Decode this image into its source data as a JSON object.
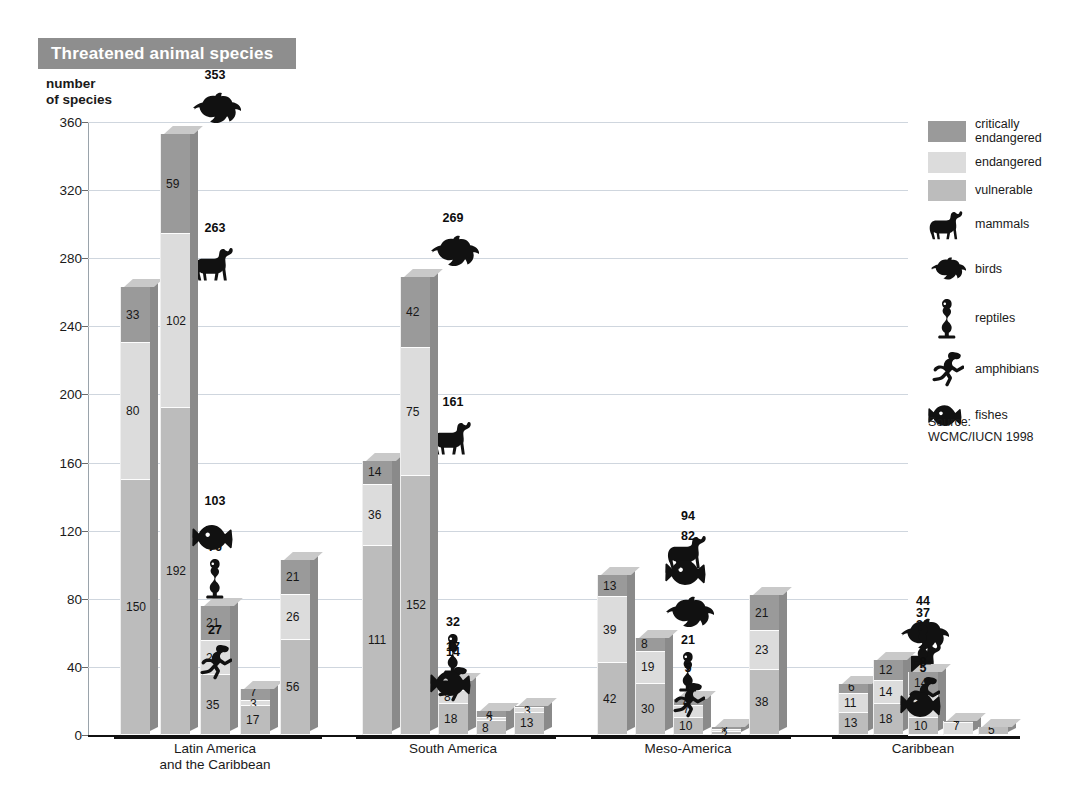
{
  "header": {
    "title": "Threatened animal species"
  },
  "axis": {
    "y_label_line1": "number",
    "y_label_line2": "of species",
    "y_ticks": [
      "360",
      "320",
      "280",
      "240",
      "200",
      "160",
      "120",
      "80",
      "40",
      "0"
    ]
  },
  "legend": {
    "swatches": [
      {
        "key": "c",
        "label_line1": "critically",
        "label_line2": "endangered",
        "color": "#9a9a9a"
      },
      {
        "key": "e",
        "label_line1": "endangered",
        "label_line2": "",
        "color": "#dcdcdc"
      },
      {
        "key": "v",
        "label_line1": "vulnerable",
        "label_line2": "",
        "color": "#bcbcbc"
      }
    ],
    "animals": [
      {
        "icon": "mammal-icon",
        "label": "mammals"
      },
      {
        "icon": "bird-icon",
        "label": "birds"
      },
      {
        "icon": "reptile-icon",
        "label": "reptiles"
      },
      {
        "icon": "amphibian-icon",
        "label": "amphibians"
      },
      {
        "icon": "fish-icon",
        "label": "fishes"
      }
    ]
  },
  "source": {
    "line1": "Source:",
    "line2": "WCMC/IUCN 1998"
  },
  "chart_data": {
    "type": "bar",
    "title": "Threatened animal species",
    "xlabel": "",
    "ylabel": "number of species",
    "ylim": [
      0,
      360
    ],
    "ytick_step": 40,
    "grid": true,
    "legend_position": "right",
    "stacked": true,
    "stack_order_bottom_to_top": [
      "vulnerable",
      "endangered",
      "critically endangered"
    ],
    "series": [
      {
        "name": "critically endangered",
        "color": "#9a9a9a"
      },
      {
        "name": "endangered",
        "color": "#dcdcdc"
      },
      {
        "name": "vulnerable",
        "color": "#bcbcbc"
      }
    ],
    "categories": [
      "Latin America and the Caribbean",
      "South America",
      "Meso-America",
      "Caribbean"
    ],
    "groups": [
      {
        "name": "Latin America\nand the Caribbean",
        "label_line1": "Latin America",
        "label_line2": "and the Caribbean",
        "bars": [
          {
            "animal": "mammals",
            "icon": "mammal-icon",
            "total": 263,
            "critically_endangered": 33,
            "endangered": 80,
            "vulnerable": 150
          },
          {
            "animal": "birds",
            "icon": "bird-icon",
            "total": 353,
            "critically_endangered": 59,
            "endangered": 102,
            "vulnerable": 192
          },
          {
            "animal": "reptiles",
            "icon": "reptile-icon",
            "total": 76,
            "critically_endangered": 21,
            "endangered": 20,
            "vulnerable": 35
          },
          {
            "animal": "amphibians",
            "icon": "amphibian-icon",
            "total": 27,
            "critically_endangered": 7,
            "endangered": 3,
            "vulnerable": 17
          },
          {
            "animal": "fishes",
            "icon": "fish-icon",
            "total": 103,
            "critically_endangered": 21,
            "endangered": 26,
            "vulnerable": 56
          }
        ]
      },
      {
        "name": "South America",
        "label_line1": "South America",
        "label_line2": "",
        "bars": [
          {
            "animal": "mammals",
            "icon": "mammal-icon",
            "total": 161,
            "critically_endangered": 14,
            "endangered": 36,
            "vulnerable": 111
          },
          {
            "animal": "birds",
            "icon": "bird-icon",
            "total": 269,
            "critically_endangered": 42,
            "endangered": 75,
            "vulnerable": 152
          },
          {
            "animal": "reptiles",
            "icon": "reptile-icon",
            "total": 32,
            "critically_endangered": 6,
            "endangered": 8,
            "vulnerable": 18
          },
          {
            "animal": "amphibians",
            "icon": "amphibian-icon",
            "total": 14,
            "critically_endangered": 4,
            "endangered": 2,
            "vulnerable": 8
          },
          {
            "animal": "fishes",
            "icon": "fish-icon",
            "total": 17,
            "critically_endangered": 1,
            "endangered": 3,
            "vulnerable": 13
          }
        ]
      },
      {
        "name": "Meso-America",
        "label_line1": "Meso-America",
        "label_line2": "",
        "bars": [
          {
            "animal": "mammals",
            "icon": "mammal-icon",
            "total": 94,
            "critically_endangered": 13,
            "endangered": 39,
            "vulnerable": 42
          },
          {
            "animal": "birds",
            "icon": "bird-icon",
            "total": 57,
            "critically_endangered": 8,
            "endangered": 19,
            "vulnerable": 30
          },
          {
            "animal": "reptiles",
            "icon": "reptile-icon",
            "total": 21,
            "critically_endangered": 4,
            "endangered": 7,
            "vulnerable": 10
          },
          {
            "animal": "amphibians",
            "icon": "amphibian-icon",
            "total": 5,
            "critically_endangered": 2,
            "endangered": 1,
            "vulnerable": 2
          },
          {
            "animal": "fishes",
            "icon": "fish-icon",
            "total": 82,
            "critically_endangered": 21,
            "endangered": 23,
            "vulnerable": 38
          }
        ]
      },
      {
        "name": "Caribbean",
        "label_line1": "Caribbean",
        "label_line2": "",
        "bars": [
          {
            "animal": "mammals",
            "icon": "mammal-icon",
            "total": 30,
            "critically_endangered": 6,
            "endangered": 11,
            "vulnerable": 13
          },
          {
            "animal": "birds",
            "icon": "bird-icon",
            "total": 44,
            "critically_endangered": 12,
            "endangered": 14,
            "vulnerable": 18
          },
          {
            "animal": "reptiles",
            "icon": "reptile-icon",
            "total": 37,
            "critically_endangered": 14,
            "endangered": 13,
            "vulnerable": 10
          },
          {
            "animal": "amphibians",
            "icon": "amphibian-icon",
            "total": 8,
            "critically_endangered": 1,
            "endangered": 7,
            "vulnerable": 0
          },
          {
            "animal": "fishes",
            "icon": "fish-icon",
            "total": 5,
            "critically_endangered": 0,
            "endangered": 0,
            "vulnerable": 5
          }
        ]
      }
    ]
  }
}
